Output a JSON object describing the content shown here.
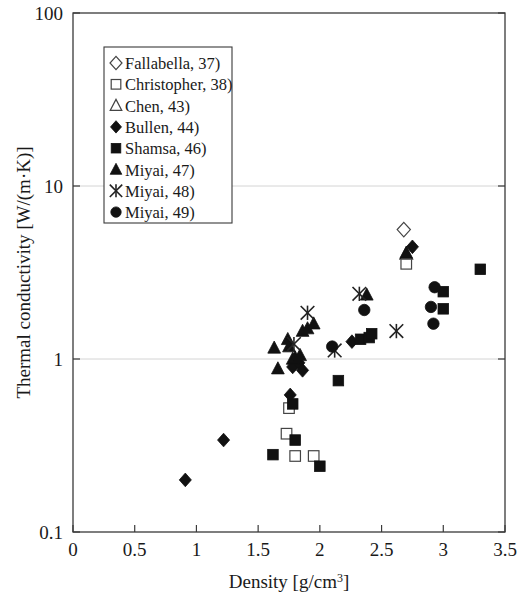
{
  "chart_data": {
    "type": "scatter",
    "title": "",
    "xlabel": "Density [g/cm3]",
    "xlabel_main": "Density  [g/cm",
    "xlabel_sup": "3",
    "xlabel_tail": "]",
    "ylabel": "Thermal conductivity [W/(m·K)]",
    "xlim": [
      0,
      3.5
    ],
    "ylim": [
      0.1,
      100
    ],
    "yscale": "log",
    "xscale": "linear",
    "grid": "horizontal-major",
    "legend_position": "upper-left-inside",
    "xticks": [
      "0",
      "0.5",
      "1",
      "1.5",
      "2",
      "2.5",
      "3",
      "3.5"
    ],
    "xtick_values": [
      0,
      0.5,
      1,
      1.5,
      2,
      2.5,
      3,
      3.5
    ],
    "yticks": [
      "0.1",
      "1",
      "10",
      "100"
    ],
    "ytick_values": [
      0.1,
      1,
      10,
      100
    ],
    "series": [
      {
        "name": "Fallabella, 37)",
        "marker": "open-diamond",
        "points": [
          [
            2.68,
            5.6
          ]
        ]
      },
      {
        "name": "Christopher, 38)",
        "marker": "open-square",
        "points": [
          [
            2.7,
            3.55
          ],
          [
            1.75,
            0.52
          ],
          [
            1.73,
            0.37
          ],
          [
            1.8,
            0.275
          ],
          [
            1.95,
            0.275
          ]
        ]
      },
      {
        "name": "Chen, 43)",
        "marker": "open-triangle",
        "points": [
          [
            2.7,
            4.05
          ]
        ]
      },
      {
        "name": "Bullen, 44)",
        "marker": "filled-diamond",
        "points": [
          [
            0.91,
            0.2
          ],
          [
            1.22,
            0.34
          ],
          [
            1.78,
            0.9
          ],
          [
            1.83,
            0.95
          ],
          [
            1.86,
            0.86
          ],
          [
            1.76,
            0.62
          ],
          [
            2.26,
            1.26
          ],
          [
            2.75,
            4.45
          ]
        ]
      },
      {
        "name": "Shamsa, 46)",
        "marker": "filled-square",
        "points": [
          [
            1.62,
            0.28
          ],
          [
            1.78,
            0.55
          ],
          [
            1.8,
            0.34
          ],
          [
            2.0,
            0.24
          ],
          [
            2.15,
            0.75
          ],
          [
            2.33,
            1.3
          ],
          [
            2.4,
            1.33
          ],
          [
            2.42,
            1.4
          ],
          [
            3.0,
            2.45
          ],
          [
            3.0,
            1.95
          ],
          [
            3.3,
            3.3
          ]
        ]
      },
      {
        "name": "Miyai, 47)",
        "marker": "filled-triangle",
        "points": [
          [
            1.63,
            1.16
          ],
          [
            1.66,
            0.88
          ],
          [
            1.74,
            1.3
          ],
          [
            1.75,
            1.18
          ],
          [
            1.78,
            1.0
          ],
          [
            1.8,
            1.02
          ],
          [
            1.84,
            1.05
          ],
          [
            1.86,
            1.45
          ],
          [
            1.9,
            1.5
          ],
          [
            1.95,
            1.6
          ],
          [
            2.38,
            2.35
          ],
          [
            2.7,
            4.1
          ]
        ]
      },
      {
        "name": "Miyai, 48)",
        "marker": "star",
        "points": [
          [
            1.79,
            1.22
          ],
          [
            1.9,
            1.85
          ],
          [
            2.12,
            1.12
          ],
          [
            2.32,
            2.38
          ],
          [
            2.62,
            1.45
          ]
        ]
      },
      {
        "name": "Miyai, 49)",
        "marker": "filled-circle",
        "points": [
          [
            2.1,
            1.18
          ],
          [
            2.36,
            1.92
          ],
          [
            2.93,
            2.6
          ],
          [
            2.9,
            2.0
          ],
          [
            2.92,
            1.6
          ]
        ]
      }
    ]
  },
  "legend": {
    "items": [
      {
        "label": "Fallabella, 37)",
        "marker": "open-diamond"
      },
      {
        "label": "Christopher, 38)",
        "marker": "open-square"
      },
      {
        "label": "Chen, 43)",
        "marker": "open-triangle"
      },
      {
        "label": "Bullen, 44)",
        "marker": "filled-diamond"
      },
      {
        "label": "Shamsa, 46)",
        "marker": "filled-square"
      },
      {
        "label": "Miyai, 47)",
        "marker": "filled-triangle"
      },
      {
        "label": "Miyai, 48)",
        "marker": "star"
      },
      {
        "label": "Miyai, 49)",
        "marker": "filled-circle"
      }
    ]
  },
  "colors": {
    "marker": "#111111",
    "axis": "#3a3a3a",
    "grid": "#cfcfcf",
    "background": "#ffffff"
  }
}
